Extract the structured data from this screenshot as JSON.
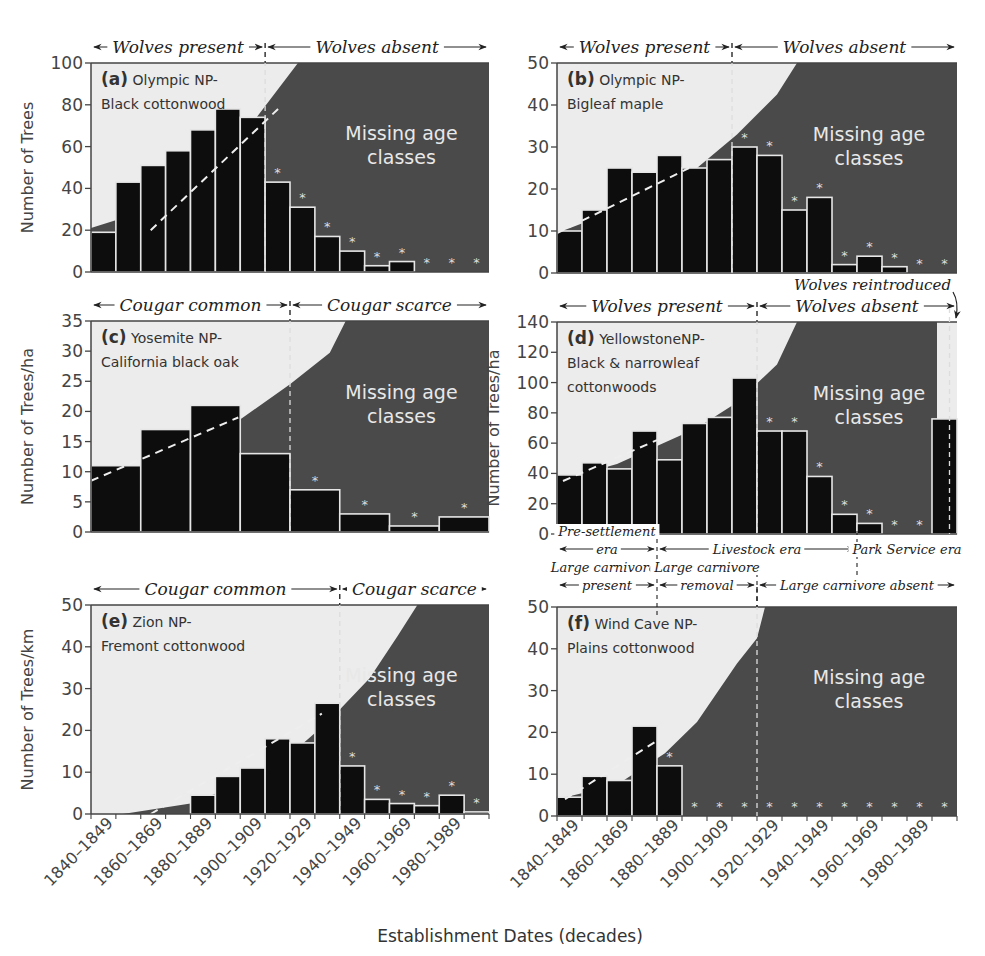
{
  "figure": {
    "xlabel": "Establishment Dates (decades)",
    "x_tick_labels": [
      "1840–1849",
      "1860–1869",
      "1880–1889",
      "1900–1909",
      "1920–1929",
      "1940–1949",
      "1960–1969",
      "1980–1989"
    ],
    "missing_label_line1": "Missing age",
    "missing_label_line2": "classes",
    "colors": {
      "bar": "#0d0d0d",
      "missing_region": "#4a4a4a",
      "background": "#ececec",
      "bar_outline": "#e6e6e6"
    }
  },
  "chart_data": [
    {
      "type": "bar",
      "panel": "a",
      "title_letter": "(a)",
      "title_line1": "Olympic NP-",
      "title_line2": "Black cottonwood",
      "ylabel": "Number of Trees",
      "ylim": [
        0,
        100
      ],
      "yticks": [
        0,
        20,
        40,
        60,
        80,
        100
      ],
      "era_left": "Wolves present",
      "era_right": "Wolves absent",
      "categories": [
        "1840–1849",
        "1850–1859",
        "1860–1869",
        "1870–1879",
        "1880–1889",
        "1890–1899",
        "1900–1909",
        "1910–1919",
        "1920–1929",
        "1930–1939",
        "1940–1949",
        "1950–1959",
        "1960–1969",
        "1970–1979",
        "1980–1989",
        "1990–1999"
      ],
      "values": [
        19,
        43,
        51,
        58,
        68,
        78,
        74,
        43,
        31,
        17,
        10,
        3,
        5,
        0,
        0,
        0
      ],
      "asterisks": [
        false,
        false,
        false,
        false,
        false,
        false,
        false,
        true,
        true,
        true,
        true,
        true,
        true,
        true,
        true,
        true
      ],
      "era_divider_index": 7
    },
    {
      "type": "bar",
      "panel": "b",
      "title_letter": "(b)",
      "title_line1": "Olympic NP-",
      "title_line2": "Bigleaf maple",
      "ylabel": "",
      "ylim": [
        0,
        50
      ],
      "yticks": [
        0,
        10,
        20,
        30,
        40,
        50
      ],
      "era_left": "Wolves present",
      "era_right": "Wolves absent",
      "categories": [
        "1840–1849",
        "1850–1859",
        "1860–1869",
        "1870–1879",
        "1880–1889",
        "1890–1899",
        "1900–1909",
        "1910–1919",
        "1920–1929",
        "1930–1939",
        "1940–1949",
        "1950–1959",
        "1960–1969",
        "1970–1979",
        "1980–1989",
        "1990–1999"
      ],
      "values": [
        10,
        15,
        25,
        24,
        28,
        25,
        27,
        30,
        28,
        15,
        18,
        2,
        4,
        1.5,
        0,
        0
      ],
      "asterisks": [
        false,
        false,
        false,
        false,
        false,
        false,
        false,
        true,
        true,
        true,
        true,
        true,
        true,
        true,
        true,
        true
      ],
      "era_divider_index": 7
    },
    {
      "type": "bar",
      "panel": "c",
      "title_letter": "(c)",
      "title_line1": "Yosemite NP-",
      "title_line2": "California black oak",
      "ylabel": "Number of Trees/ha",
      "ylim": [
        0,
        35
      ],
      "yticks": [
        0,
        5,
        10,
        15,
        20,
        25,
        30,
        35
      ],
      "era_left": "Cougar common",
      "era_right": "Cougar scarce",
      "categories": [
        "1840–1859",
        "1860–1879",
        "1880–1899",
        "1900–1919",
        "1920–1939",
        "1940–1959",
        "1960–1979",
        "1980–1999"
      ],
      "values": [
        11,
        17,
        21,
        13,
        7,
        3,
        1,
        2.5
      ],
      "asterisks": [
        false,
        false,
        false,
        false,
        true,
        true,
        true,
        true
      ],
      "era_divider_index": 4
    },
    {
      "type": "bar",
      "panel": "d",
      "title_letter": "(d)",
      "title_line1": "YellowstoneNP-",
      "title_line2": "Black & narrowleaf",
      "title_line3": "cottonwoods",
      "ylabel": "Number of Trees/ha",
      "ylim": [
        0,
        140
      ],
      "yticks": [
        0,
        20,
        40,
        60,
        80,
        100,
        120,
        140
      ],
      "era_left": "Wolves present",
      "era_right": "Wolves absent",
      "annotation": "Wolves reintroduced",
      "categories": [
        "1840–1849",
        "1850–1859",
        "1860–1869",
        "1870–1879",
        "1880–1889",
        "1890–1899",
        "1900–1909",
        "1910–1919",
        "1920–1929",
        "1930–1939",
        "1940–1949",
        "1950–1959",
        "1960–1969",
        "1970–1979",
        "1980–1989",
        "1990–1999"
      ],
      "values": [
        39,
        47,
        43,
        68,
        49,
        73,
        77,
        103,
        68,
        68,
        38,
        13,
        7,
        0,
        0,
        76
      ],
      "asterisks": [
        false,
        false,
        false,
        false,
        false,
        false,
        false,
        false,
        true,
        true,
        true,
        true,
        true,
        true,
        true,
        false
      ],
      "era_divider_index": 8
    },
    {
      "type": "bar",
      "panel": "e",
      "title_letter": "(e)",
      "title_line1": "Zion NP-",
      "title_line2": "Fremont cottonwood",
      "ylabel": "Number of Trees/km",
      "ylim": [
        0,
        50
      ],
      "yticks": [
        0,
        10,
        20,
        30,
        40,
        50
      ],
      "era_left": "Cougar common",
      "era_right": "Cougar scarce",
      "categories": [
        "1840–1849",
        "1850–1859",
        "1860–1869",
        "1870–1879",
        "1880–1889",
        "1890–1899",
        "1900–1909",
        "1910–1919",
        "1920–1929",
        "1930–1939",
        "1940–1949",
        "1950–1959",
        "1960–1969",
        "1970–1979",
        "1980–1989",
        "1990–1999"
      ],
      "values": [
        0,
        0,
        0,
        0,
        4.5,
        9,
        11,
        18,
        17,
        26.5,
        11.5,
        3.5,
        2.5,
        2,
        4.5,
        0.5
      ],
      "asterisks": [
        false,
        false,
        false,
        false,
        false,
        false,
        false,
        false,
        false,
        false,
        true,
        true,
        true,
        true,
        true,
        true
      ],
      "era_divider_index": 10
    },
    {
      "type": "bar",
      "panel": "f",
      "title_letter": "(f)",
      "title_line1": "Wind Cave NP-",
      "title_line2": "Plains cottonwood",
      "ylabel": "",
      "ylim": [
        0,
        50
      ],
      "yticks": [
        0,
        10,
        20,
        30,
        40,
        50
      ],
      "era_row1": [
        "Pre-settlement era",
        "Livestock era",
        "Park Service era"
      ],
      "era_row2": [
        "Large carnivores present",
        "Large carnivore removal",
        "Large carnivore absent"
      ],
      "categories": [
        "1840–1849",
        "1850–1859",
        "1860–1869",
        "1870–1879",
        "1880–1889",
        "1890–1899",
        "1900–1909",
        "1910–1919",
        "1920–1929",
        "1930–1939",
        "1940–1949",
        "1950–1959",
        "1960–1969",
        "1970–1979",
        "1980–1989",
        "1990–1999"
      ],
      "values": [
        4.5,
        9.5,
        8.5,
        21.5,
        12,
        0,
        0,
        0,
        0,
        0,
        0,
        0,
        0,
        0,
        0,
        0
      ],
      "asterisks": [
        false,
        false,
        false,
        false,
        true,
        true,
        true,
        true,
        true,
        true,
        true,
        true,
        true,
        true,
        true,
        true
      ],
      "era_divider_index": 8
    }
  ]
}
